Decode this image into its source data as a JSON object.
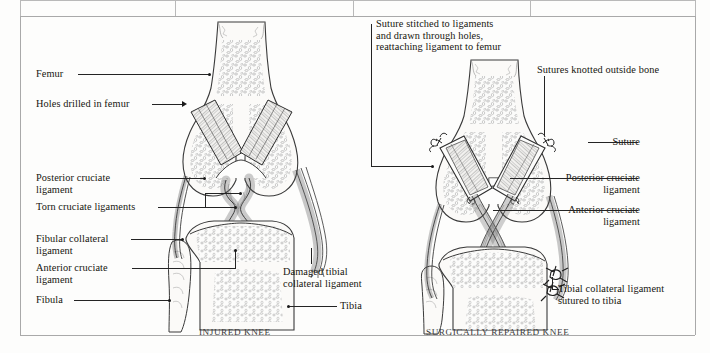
{
  "page": {
    "background_color": "#fdfdfc",
    "frame_color": "#a9a9a9"
  },
  "figure": {
    "type": "medical-illustration",
    "panels": [
      {
        "id": "injured-knee",
        "caption": "INJURED KNEE",
        "labels": [
          {
            "id": "femur",
            "text": "Femur",
            "side": "left",
            "leader": "dot"
          },
          {
            "id": "holes-drilled",
            "text": "Holes drilled in femur",
            "side": "left",
            "leader": "arrow"
          },
          {
            "id": "posterior-cruciate",
            "text": "Posterior cruciate\nligament",
            "side": "left",
            "leader": "dot"
          },
          {
            "id": "torn-cruciate",
            "text": "Torn cruciate ligaments",
            "side": "left",
            "leader": "bracket"
          },
          {
            "id": "fibular-collateral",
            "text": "Fibular collateral\nligament",
            "side": "left",
            "leader": "dot"
          },
          {
            "id": "anterior-cruciate",
            "text": "Anterior cruciate\nligament",
            "side": "left",
            "leader": "dot"
          },
          {
            "id": "fibula",
            "text": "Fibula",
            "side": "left",
            "leader": "dot"
          },
          {
            "id": "damaged-tibial-collateral",
            "text": "Damaged tibial\ncollateral ligament",
            "side": "right",
            "leader": "line"
          },
          {
            "id": "tibia",
            "text": "Tibia",
            "side": "right",
            "leader": "dot"
          }
        ]
      },
      {
        "id": "surgically-repaired-knee",
        "caption": "SURGICALLY REPAIRED KNEE",
        "labels": [
          {
            "id": "suture-stitched-note",
            "text": "Suture stitched to ligaments\nand drawn through holes,\nreattaching ligament to femur",
            "side": "top",
            "leader": "bracket"
          },
          {
            "id": "sutures-knotted",
            "text": "Sutures knotted outside bone",
            "side": "top-right",
            "leader": "line"
          },
          {
            "id": "suture",
            "text": "Suture",
            "side": "right",
            "leader": "line"
          },
          {
            "id": "posterior-cruciate-r",
            "text": "Posterior cruciate\nligament",
            "side": "right",
            "leader": "line"
          },
          {
            "id": "anterior-cruciate-r",
            "text": "Anterior cruciate\nligament",
            "side": "right",
            "leader": "line"
          },
          {
            "id": "tibial-collateral-sutured",
            "text": "Tibial collateral ligament\nsutured to tibia",
            "side": "right",
            "leader": "bracket"
          }
        ]
      }
    ]
  }
}
